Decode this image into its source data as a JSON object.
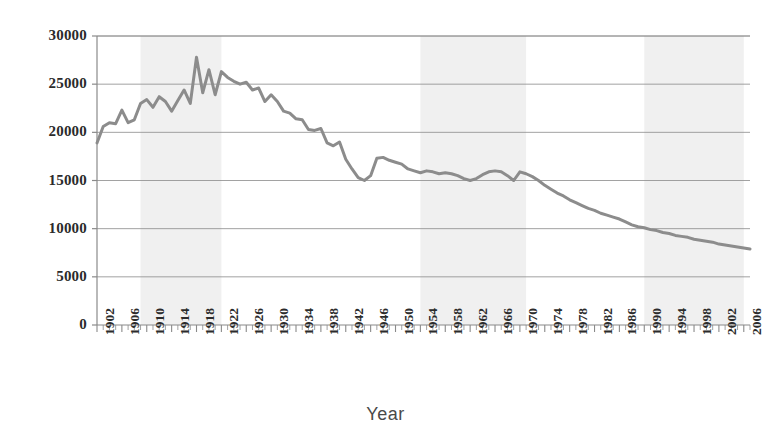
{
  "chart_data": {
    "type": "line",
    "title": "",
    "xlabel": "Year",
    "ylabel": "",
    "ylim": [
      0,
      30000
    ],
    "xlim": [
      1902,
      2007
    ],
    "grid": true,
    "legend": null,
    "y_ticks": [
      "0",
      "5000",
      "10000",
      "15000",
      "20000",
      "25000",
      "30000"
    ],
    "y_tick_values": [
      0,
      5000,
      10000,
      15000,
      20000,
      25000,
      30000
    ],
    "x_tick_labels": [
      "1902",
      "1906",
      "1910",
      "1914",
      "1918",
      "1922",
      "1926",
      "1930",
      "1934",
      "1938",
      "1942",
      "1946",
      "1950",
      "1954",
      "1958",
      "1962",
      "1966",
      "1970",
      "1974",
      "1978",
      "1982",
      "1986",
      "1990",
      "1994",
      "1998",
      "2002",
      "2006"
    ],
    "x_tick_values": [
      1902,
      1906,
      1910,
      1914,
      1918,
      1922,
      1926,
      1930,
      1934,
      1938,
      1942,
      1946,
      1950,
      1954,
      1958,
      1962,
      1966,
      1970,
      1974,
      1978,
      1982,
      1986,
      1990,
      1994,
      1998,
      2002,
      2006
    ],
    "line_color": "#8c8c8c",
    "line_width": 3,
    "shaded_band_color": "#f0f0f0",
    "shaded_bands": [
      {
        "start": 1909,
        "end": 1922
      },
      {
        "start": 1954,
        "end": 1971
      },
      {
        "start": 1990,
        "end": 2006
      }
    ],
    "x": [
      1902,
      1903,
      1904,
      1905,
      1906,
      1907,
      1908,
      1909,
      1910,
      1911,
      1912,
      1913,
      1914,
      1915,
      1916,
      1917,
      1918,
      1919,
      1920,
      1921,
      1922,
      1923,
      1924,
      1925,
      1926,
      1927,
      1928,
      1929,
      1930,
      1931,
      1932,
      1933,
      1934,
      1935,
      1936,
      1937,
      1938,
      1939,
      1940,
      1941,
      1942,
      1943,
      1944,
      1945,
      1946,
      1947,
      1948,
      1949,
      1950,
      1951,
      1952,
      1953,
      1954,
      1955,
      1956,
      1957,
      1958,
      1959,
      1960,
      1961,
      1962,
      1963,
      1964,
      1965,
      1966,
      1967,
      1968,
      1969,
      1970,
      1971,
      1972,
      1973,
      1974,
      1975,
      1976,
      1977,
      1978,
      1979,
      1980,
      1981,
      1982,
      1983,
      1984,
      1985,
      1986,
      1987,
      1988,
      1989,
      1990,
      1991,
      1992,
      1993,
      1994,
      1995,
      1996,
      1997,
      1998,
      1999,
      2000,
      2001,
      2002,
      2003,
      2004,
      2005,
      2006,
      2007
    ],
    "values": [
      18900,
      20600,
      21000,
      20900,
      22300,
      21000,
      21300,
      23000,
      23400,
      22600,
      23700,
      23200,
      22200,
      23300,
      24400,
      23000,
      27800,
      24100,
      26500,
      23900,
      26300,
      25700,
      25300,
      25000,
      25200,
      24400,
      24600,
      23200,
      23900,
      23200,
      22200,
      22000,
      21400,
      21300,
      20300,
      20200,
      20400,
      18900,
      18600,
      19000,
      17200,
      16200,
      15300,
      15000,
      15500,
      17300,
      17400,
      17100,
      16900,
      16700,
      16200,
      16000,
      15800,
      16000,
      15900,
      15700,
      15800,
      15700,
      15500,
      15200,
      15000,
      15200,
      15600,
      15900,
      16000,
      15900,
      15500,
      15000,
      15900,
      15700,
      15400,
      15000,
      14500,
      14100,
      13700,
      13400,
      13000,
      12700,
      12400,
      12100,
      11900,
      11600,
      11400,
      11200,
      11000,
      10700,
      10400,
      10200,
      10100,
      9900,
      9800,
      9600,
      9500,
      9300,
      9200,
      9100,
      8900,
      8800,
      8700,
      8600,
      8400,
      8300,
      8200,
      8100,
      8000,
      7900
    ]
  }
}
